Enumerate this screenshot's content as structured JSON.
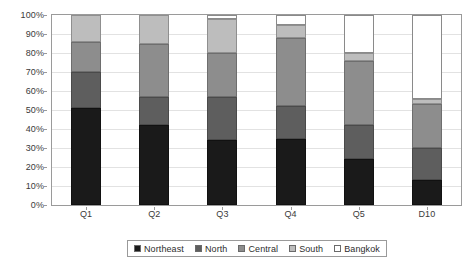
{
  "chart_data": {
    "type": "bar",
    "subtype": "stacked-100-percent",
    "title": "",
    "xlabel": "",
    "ylabel": "",
    "categories": [
      "Q1",
      "Q2",
      "Q3",
      "Q4",
      "Q5",
      "D10"
    ],
    "series": [
      {
        "name": "Northeast",
        "color": "#1a1a1a",
        "values": [
          51,
          42,
          34,
          35,
          24,
          13
        ]
      },
      {
        "name": "North",
        "color": "#5e5e5e",
        "values": [
          19,
          15,
          23,
          17,
          18,
          17
        ]
      },
      {
        "name": "Central",
        "color": "#8d8d8d",
        "values": [
          16,
          28,
          23,
          36,
          34,
          23
        ]
      },
      {
        "name": "South",
        "color": "#bdbdbd",
        "values": [
          14,
          15,
          18,
          7,
          4,
          3
        ]
      },
      {
        "name": "Bangkok",
        "color": "#ffffff",
        "values": [
          0,
          0,
          2,
          5,
          20,
          44
        ]
      }
    ],
    "ylim": [
      0,
      100
    ],
    "y_ticks": [
      0,
      10,
      20,
      30,
      40,
      50,
      60,
      70,
      80,
      90,
      100
    ],
    "y_tick_labels": [
      "0%",
      "10%",
      "20%",
      "30%",
      "40%",
      "50%",
      "60%",
      "70%",
      "80%",
      "90%",
      "100%"
    ],
    "grid": true,
    "legend_position": "bottom",
    "legend_entries": [
      "Northeast",
      "North",
      "Central",
      "South",
      "Bangkok"
    ]
  }
}
